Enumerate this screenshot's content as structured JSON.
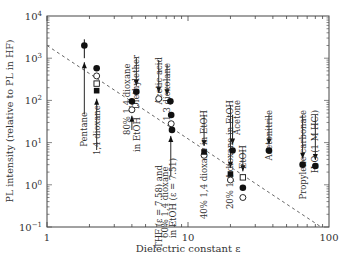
{
  "chart_data": {
    "type": "scatter",
    "title": "",
    "xlabel": "Dielectric constant ε",
    "ylabel": "PL intensity (relative to PL in HF)",
    "xscale": "log",
    "yscale": "log",
    "xlim": [
      1,
      100
    ],
    "ylim": [
      0.1,
      10000
    ],
    "x_ticks": [
      {
        "value": 1,
        "label": "1"
      },
      {
        "value": 10,
        "label": "10"
      },
      {
        "value": 100,
        "label": "100"
      }
    ],
    "y_ticks": [
      {
        "value": 0.1,
        "base": "10",
        "exp": "−1"
      },
      {
        "value": 1,
        "base": "10",
        "exp": "0"
      },
      {
        "value": 10,
        "base": "10",
        "exp": "1"
      },
      {
        "value": 100,
        "base": "10",
        "exp": "2"
      },
      {
        "value": 1000,
        "base": "10",
        "exp": "3"
      },
      {
        "value": 10000,
        "base": "10",
        "exp": "4"
      }
    ],
    "grid": false,
    "legend": null,
    "series": [
      {
        "name": "filled circles",
        "marker": "filled-circle",
        "points": [
          {
            "x": 1.84,
            "y": 2000,
            "err_low": 1000,
            "err_high": 2800
          },
          {
            "x": 2.25,
            "y": 580
          },
          {
            "x": 4.3,
            "y": 160
          },
          {
            "x": 4.0,
            "y": 95
          },
          {
            "x": 7.5,
            "y": 95
          },
          {
            "x": 7.6,
            "y": 45
          },
          {
            "x": 7.7,
            "y": 20
          },
          {
            "x": 20.7,
            "y": 6.5
          },
          {
            "x": 24.5,
            "y": 0.85
          },
          {
            "x": 37.5,
            "y": 6.5
          },
          {
            "x": 65,
            "y": 3
          },
          {
            "x": 80,
            "y": 2.8
          }
        ]
      },
      {
        "name": "open circles",
        "marker": "open-circle",
        "points": [
          {
            "x": 2.25,
            "y": 380
          },
          {
            "x": 4.0,
            "y": 60
          },
          {
            "x": 6.2,
            "y": 110
          },
          {
            "x": 7.6,
            "y": 28
          },
          {
            "x": 13,
            "y": 5
          },
          {
            "x": 20,
            "y": 1.3
          },
          {
            "x": 24.5,
            "y": 0.5
          }
        ]
      },
      {
        "name": "open squares",
        "marker": "open-square",
        "points": [
          {
            "x": 2.25,
            "y": 250
          },
          {
            "x": 24.5,
            "y": 1.5
          }
        ]
      },
      {
        "name": "filled squares",
        "marker": "filled-square",
        "points": [
          {
            "x": 2.25,
            "y": 170
          },
          {
            "x": 13,
            "y": 6
          },
          {
            "x": 20,
            "y": 1.8
          }
        ]
      }
    ],
    "fit_line": {
      "style": "dashed",
      "x": [
        1,
        88
      ],
      "y": [
        2000,
        0.1
      ]
    },
    "annotations": [
      {
        "text": "Pentane",
        "x": 1.84,
        "arrow": "up"
      },
      {
        "text": "1,4 dioxane",
        "x": 2.25,
        "arrow": "up"
      },
      {
        "text": "Diethylether",
        "x": 4.3,
        "arrow": "down"
      },
      {
        "text": "80% 1,4 dioxane in EtOH",
        "x": 4.0,
        "arrow": "up"
      },
      {
        "text": "Acetic acid",
        "x": 6.2,
        "arrow": "down"
      },
      {
        "text": "1,3 dioxolane",
        "x": 7.1,
        "arrow": "down"
      },
      {
        "text": "THF (ε = 7.58) and 60% 1,4 dioxane in EtOH (ε = 7.51)",
        "x": 7.55,
        "arrow": "up"
      },
      {
        "text": "40% 1,4 dioxane in EtOH",
        "x": 13,
        "arrow": "down"
      },
      {
        "text": "20% 1,4 dioxane in EtOH",
        "x": 20,
        "arrow": "down"
      },
      {
        "text": "Acetone",
        "x": 20.7,
        "arrow": "down"
      },
      {
        "text": "EtOH",
        "x": 24.5,
        "arrow": "down"
      },
      {
        "text": "Acetonitrile",
        "x": 37.5,
        "arrow": "down"
      },
      {
        "text": "Propylene carbonate",
        "x": 65,
        "arrow": "down"
      },
      {
        "text": "H₂O (1 M HCl)",
        "x": 80,
        "arrow": "down"
      }
    ]
  }
}
